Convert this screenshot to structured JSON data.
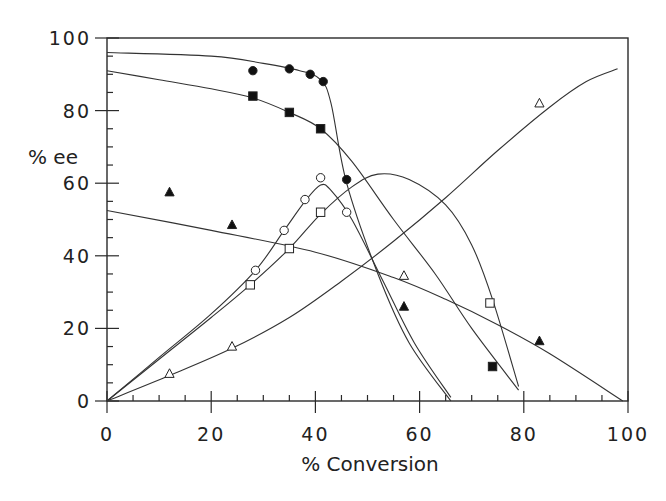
{
  "chart_data": {
    "type": "scatter",
    "title": "",
    "xlabel": "% Conversion",
    "ylabel": "% ee",
    "xlim": [
      0,
      100
    ],
    "ylim": [
      0,
      100
    ],
    "x_ticks": [
      "0",
      "20",
      "40",
      "60",
      "80",
      "100"
    ],
    "y_ticks": [
      "0",
      "20",
      "40",
      "60",
      "80",
      "100"
    ],
    "grid": false,
    "legend": null,
    "series": [
      {
        "name": "filled circles",
        "marker": "filled-circle",
        "points": [
          [
            28,
            91
          ],
          [
            35,
            91.5
          ],
          [
            39,
            90
          ],
          [
            41.5,
            88
          ],
          [
            46,
            61
          ]
        ],
        "fit_curve": [
          [
            0,
            96
          ],
          [
            20,
            95
          ],
          [
            30,
            93
          ],
          [
            37,
            91
          ],
          [
            41,
            88.5
          ],
          [
            43,
            82
          ],
          [
            46,
            60
          ],
          [
            52,
            35
          ],
          [
            58,
            16
          ],
          [
            66,
            0
          ]
        ]
      },
      {
        "name": "filled squares",
        "marker": "filled-square",
        "points": [
          [
            28,
            84
          ],
          [
            35,
            79.5
          ],
          [
            41,
            75
          ],
          [
            74,
            9.5
          ]
        ],
        "fit_curve": [
          [
            0,
            91
          ],
          [
            10,
            88.5
          ],
          [
            20,
            86
          ],
          [
            28,
            83.5
          ],
          [
            35,
            79.5
          ],
          [
            41,
            75
          ],
          [
            47,
            66
          ],
          [
            55,
            50
          ],
          [
            63,
            35
          ],
          [
            70,
            20
          ],
          [
            79,
            3
          ]
        ]
      },
      {
        "name": "open circles",
        "marker": "open-circle",
        "points": [
          [
            28.5,
            36
          ],
          [
            34,
            47
          ],
          [
            38,
            55.5
          ],
          [
            41,
            61.5
          ],
          [
            46,
            52
          ]
        ],
        "fit_curve": [
          [
            0,
            0
          ],
          [
            10,
            12
          ],
          [
            20,
            24
          ],
          [
            28.5,
            36
          ],
          [
            34,
            47
          ],
          [
            38,
            55
          ],
          [
            41,
            59.5
          ],
          [
            43,
            58
          ],
          [
            47,
            50
          ],
          [
            53,
            33
          ],
          [
            59,
            16
          ],
          [
            66,
            1
          ]
        ]
      },
      {
        "name": "open squares",
        "marker": "open-square",
        "points": [
          [
            27.5,
            32
          ],
          [
            35,
            42
          ],
          [
            41,
            52
          ],
          [
            73.5,
            27
          ]
        ],
        "fit_curve": [
          [
            0,
            0
          ],
          [
            10,
            11.5
          ],
          [
            20,
            23
          ],
          [
            27.5,
            32
          ],
          [
            35,
            42
          ],
          [
            41,
            51.5
          ],
          [
            47,
            59
          ],
          [
            52,
            62.5
          ],
          [
            58,
            61
          ],
          [
            65,
            54
          ],
          [
            70,
            43
          ],
          [
            74,
            28
          ],
          [
            79,
            4
          ]
        ]
      },
      {
        "name": "filled triangles",
        "marker": "filled-triangle",
        "points": [
          [
            12,
            57.5
          ],
          [
            24,
            48.5
          ],
          [
            57,
            26
          ],
          [
            83,
            16.5
          ]
        ],
        "fit_curve": [
          [
            0,
            52.5
          ],
          [
            20,
            47
          ],
          [
            40,
            41
          ],
          [
            55,
            34
          ],
          [
            65,
            28
          ],
          [
            75,
            21
          ],
          [
            85,
            13
          ],
          [
            99,
            0
          ]
        ]
      },
      {
        "name": "open triangles",
        "marker": "open-triangle",
        "points": [
          [
            12,
            7.5
          ],
          [
            24,
            15
          ],
          [
            57,
            34.5
          ],
          [
            83,
            82
          ]
        ],
        "fit_curve": [
          [
            0,
            0
          ],
          [
            12,
            7
          ],
          [
            24,
            14.5
          ],
          [
            35,
            23
          ],
          [
            45,
            33
          ],
          [
            55,
            44
          ],
          [
            65,
            56
          ],
          [
            75,
            69
          ],
          [
            85,
            81
          ],
          [
            92,
            88
          ],
          [
            98,
            91.5
          ]
        ]
      }
    ]
  }
}
